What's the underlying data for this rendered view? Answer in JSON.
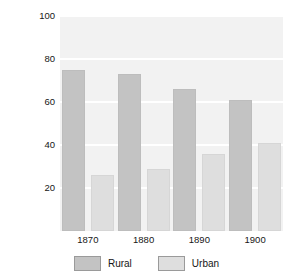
{
  "chart_data": {
    "type": "bar",
    "title": "",
    "subtitle": "",
    "xlabel": "",
    "ylabel": "Percent of U.S. population",
    "categories": [
      "1870",
      "1880",
      "1890",
      "1900"
    ],
    "series": [
      {
        "name": "Rural",
        "values": [
          75,
          73,
          66,
          61
        ],
        "color": "#c3c3c3"
      },
      {
        "name": "Urban",
        "values": [
          26,
          29,
          36,
          41
        ],
        "color": "#dedede"
      }
    ],
    "ylim": [
      0,
      100
    ],
    "yticks": [
      20,
      40,
      60,
      80,
      100
    ],
    "ytick_labels": [
      "20",
      "40",
      "60",
      "80",
      "100"
    ],
    "grid": true,
    "grid_axis": "y",
    "legend_position": "bottom",
    "legend_entries": [
      "Rural",
      "Urban"
    ],
    "annotations": [],
    "plot_background": "#f2f2f2",
    "figure_background": "#ffffff"
  }
}
